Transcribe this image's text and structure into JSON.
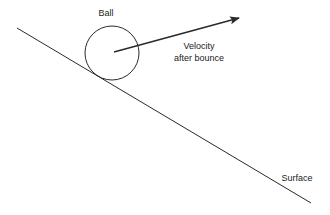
{
  "diagram": {
    "labels": {
      "ball": "Ball",
      "velocity_line1": "Velocity",
      "velocity_line2": "after bounce",
      "surface": "Surface"
    },
    "colors": {
      "stroke": "#2a2a2a",
      "text": "#222222",
      "background": "#ffffff"
    }
  }
}
